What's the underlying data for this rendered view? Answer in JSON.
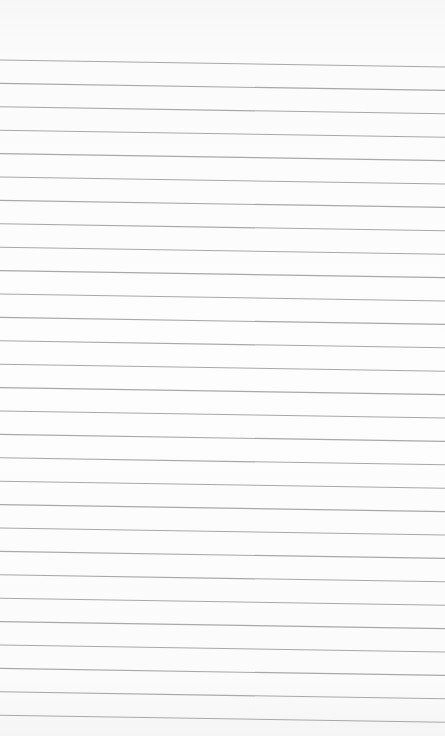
{
  "page": {
    "type": "ruled-notepad-sheet",
    "background_color": "#fcfcfc",
    "line_color": "#a8a8a8",
    "line_count": 29,
    "first_line_y_left": 60,
    "line_spacing": 23.4,
    "line_slope_px": 7
  }
}
